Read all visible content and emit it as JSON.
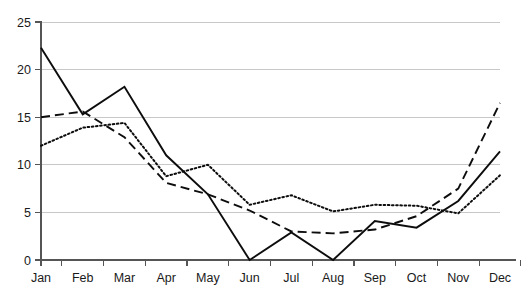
{
  "chart_data": {
    "type": "line",
    "title": "",
    "subtitle": "",
    "xlabel": "",
    "ylabel": "",
    "xlim_categories": [
      "Jan",
      "Feb",
      "Mar",
      "Apr",
      "May",
      "Jun",
      "Jul",
      "Aug",
      "Sep",
      "Oct",
      "Nov",
      "Dec"
    ],
    "categories": [
      "Jan",
      "Feb",
      "Mar",
      "Apr",
      "May",
      "Jun",
      "Jul",
      "Aug",
      "Sep",
      "Oct",
      "Nov",
      "Dec"
    ],
    "ylim": [
      0,
      25
    ],
    "yticks": [
      0,
      5,
      10,
      15,
      20,
      25
    ],
    "ytick_labels": [
      "0",
      "5",
      "10",
      "15",
      "20",
      "25"
    ],
    "grid": "horizontal",
    "legend": "none",
    "annotations": [],
    "series": [
      {
        "name": "series-solid",
        "style": "solid",
        "color": "#0d0d0d",
        "values": [
          22.3,
          15.3,
          18.2,
          11.0,
          6.9,
          0.0,
          2.9,
          0.0,
          4.1,
          3.4,
          6.2,
          11.4
        ]
      },
      {
        "name": "series-dashed",
        "style": "dashed",
        "color": "#0d0d0d",
        "values": [
          15.0,
          15.6,
          12.9,
          8.1,
          6.9,
          5.2,
          3.0,
          2.8,
          3.2,
          4.6,
          7.5,
          16.5
        ]
      },
      {
        "name": "series-dotted",
        "style": "dotted",
        "color": "#0d0d0d",
        "values": [
          12.0,
          13.9,
          14.4,
          8.8,
          10.0,
          5.8,
          6.8,
          5.1,
          5.8,
          5.7,
          4.9,
          8.9
        ]
      }
    ]
  },
  "axes": {
    "y_labels": [
      "25",
      "20",
      "15",
      "10",
      "5",
      "0"
    ],
    "x_labels": [
      "Jan",
      "Feb",
      "Mar",
      "Apr",
      "May",
      "Jun",
      "Jul",
      "Aug",
      "Sep",
      "Oct",
      "Nov",
      "Dec"
    ]
  },
  "colors": {
    "gridline": "#c8c8c8",
    "axis": "#555555",
    "series": "#0d0d0d",
    "background": "#ffffff"
  }
}
